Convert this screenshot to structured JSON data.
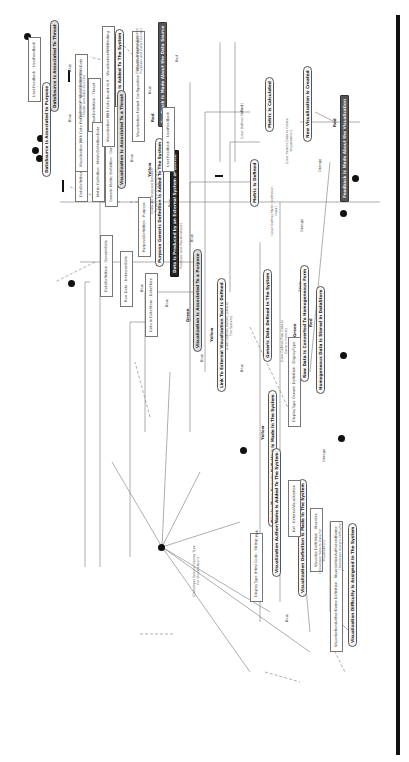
{
  "diagram": {
    "type": "UML activity diagram (rotated 90°)",
    "activities": [
      {
        "id": "a1",
        "label": "DataSource Is Associated To Threat",
        "color_tag": "Green"
      },
      {
        "id": "a2",
        "label": "DataSource Is Associated to Purpose",
        "color_tag": ""
      },
      {
        "id": "a3",
        "label": "Threat Generic Definition Is Added To The System",
        "color_tag": "Yellow"
      },
      {
        "id": "a4",
        "label": "Visualization Is Associated To a Threat",
        "color_tag": "Green"
      },
      {
        "id": "a5",
        "label": "Purpose Generic Definition Is Added To The System",
        "color_tag": "Yellow"
      },
      {
        "id": "a6",
        "label": "Data Is Produced by an External System or Device",
        "color_tag": ""
      },
      {
        "id": "a7",
        "label": "Visualization Is Associated To a Purpose",
        "color_tag": "Green"
      },
      {
        "id": "a8",
        "label": "Link To External Visualization Tool Is Defined",
        "color_tag": "Yellow"
      },
      {
        "id": "a9",
        "label": "Display/Type Generic Definition Is Made In The System",
        "color_tag": "Yellow"
      },
      {
        "id": "a10",
        "label": "Visualization Author/Name Is Added To The System",
        "color_tag": ""
      },
      {
        "id": "a11",
        "label": "Visualization Definition Is Made In The System",
        "color_tag": ""
      },
      {
        "id": "a12",
        "label": "Visualization Difficulty Is Assigned In The System",
        "color_tag": ""
      },
      {
        "id": "a13",
        "label": "Generic Data Defined In The System",
        "color_tag": ""
      },
      {
        "id": "a14",
        "label": "Raw Data Is Converted To Homogeneous Form",
        "color_tag": "Green"
      },
      {
        "id": "a15",
        "label": "Homogeneous Data Is Stored In DataStore",
        "color_tag": "Red"
      },
      {
        "id": "a16",
        "label": "Metric Is Defined",
        "color_tag": ""
      },
      {
        "id": "a17",
        "label": "Metric Is Calculated",
        "color_tag": ""
      },
      {
        "id": "a18",
        "label": "New Visualization Is Created",
        "color_tag": ""
      },
      {
        "id": "a19",
        "label": "Feedback Is Made About the Visualization",
        "color_tag": "Red"
      },
      {
        "id": "a20",
        "label": "Feedback Is Made About the Data Source",
        "color_tag": "Red"
      }
    ],
    "notes": [
      {
        "id": "n1",
        "label": "ThreatDefinition : Threat"
      },
      {
        "id": "n2",
        "label": "PurposeDefinition : Purpose"
      },
      {
        "id": "n3",
        "label": "Raw Data : UnknownData"
      },
      {
        "id": "n4",
        "label": "DataDefinition : GenericData"
      },
      {
        "id": "n5",
        "label": "DataDefinition : MetricDefinition"
      },
      {
        "id": "n6",
        "label": "Metric Definition : MetricDefinitionData"
      },
      {
        "id": "n7",
        "label": "Generic Metric Definition : GenericMetricDefinition"
      },
      {
        "id": "n8",
        "label": "User Feedback : UserFeedback"
      },
      {
        "id": "n9",
        "label": "User Feedback : UserFeedback"
      },
      {
        "id": "n10",
        "label": "Data In DataStore : DataStore"
      },
      {
        "id": "n11",
        "label": "Visualization With Data Plotted On It : VisualizationWithData"
      },
      {
        "id": "n12",
        "label": "Visualization With Data Bound to It : VisualizationWithBinding"
      },
      {
        "id": "n13",
        "label": "Visualization Format Configuration : VisualizationFormat"
      },
      {
        "id": "n14",
        "label": "DisplayType Generic Definition : DisplayType"
      },
      {
        "id": "n15",
        "label": "DisplayType (Html Code : String)"
      },
      {
        "id": "n16",
        "label": "Ext : ExternalVisualization"
      },
      {
        "id": "n17",
        "label": "Visualize Definition : Visualize"
      },
      {
        "id": "n18",
        "label": "VisualizationAuthor/Name Definition : VisualizationAuthorandName"
      }
    ],
    "edge_labels": [
      "Blue",
      "Blue",
      "Blue",
      "Blue",
      "Blue",
      "Blue",
      "Blue",
      "Blue",
      "Blue",
      "Blue",
      "Blue",
      "Pink",
      "Orange",
      "Orange",
      "Orange",
      "Green",
      "Red",
      "Red"
    ],
    "guards": {
      "g1": "[Data are Analysed Between Threats and Data Sources]",
      "g2": "[Data are Analysed Between Purposes and Data Sources]",
      "g3": "[Data are Analysed Between Threats and Visualizations]",
      "g4": "[Data are Analysed Between Purposes and Visualizations]",
      "g5": "[User Defines Raw Data to Generic Format]",
      "g6": "[User Defines Metrics]",
      "g7": "[User Defines Generic Data to The System]",
      "g8": "[User Selects Data to Create Visualization]",
      "g9": "[User Defines Metric Definition Data]",
      "g10": "[Developer Selects Display Type For Visualization]",
      "g11": "[Developer Selects Data For Visualization]",
      "g12": "[Developer Assigns Difficulty]"
    },
    "color_tags": {
      "green": "Green",
      "yellow": "Yellow",
      "red": "Red",
      "blue": "Blue",
      "orange": "Orange",
      "pink": "Pink"
    }
  }
}
